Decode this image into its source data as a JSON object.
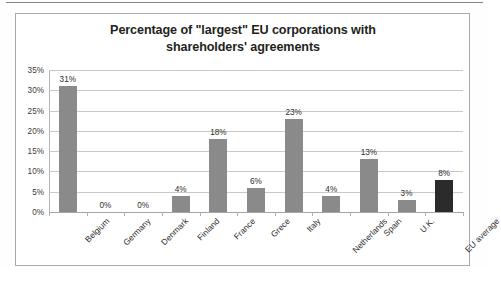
{
  "chart_data": {
    "type": "bar",
    "title": "Percentage of \"largest\" EU corporations with shareholders' agreements",
    "title_line1": "Percentage of \"largest\" EU corporations with",
    "title_line2": "shareholders' agreements",
    "xlabel": "",
    "ylabel": "",
    "ylim": [
      0,
      35
    ],
    "ytick_step": 5,
    "ytick_labels": [
      "35%",
      "30%",
      "25%",
      "20%",
      "15%",
      "10%",
      "5%",
      "0%"
    ],
    "ytick_values": [
      35,
      30,
      25,
      20,
      15,
      10,
      5,
      0
    ],
    "grid": true,
    "legend": false,
    "categories": [
      "Belgium",
      "Germany",
      "Denmark",
      "Finland",
      "France",
      "Grece",
      "Italy",
      "Netherlands",
      "Spain",
      "U.K.",
      "EU average"
    ],
    "values": [
      31,
      0,
      0,
      4,
      18,
      6,
      23,
      4,
      13,
      3,
      8
    ],
    "data_labels": [
      "31%",
      "0%",
      "0%",
      "4%",
      "18%",
      "6%",
      "23%",
      "4%",
      "13%",
      "3%",
      "8%"
    ],
    "bar_colors": [
      "#8a8a8a",
      "#8a8a8a",
      "#8a8a8a",
      "#8a8a8a",
      "#8a8a8a",
      "#8a8a8a",
      "#8a8a8a",
      "#8a8a8a",
      "#8a8a8a",
      "#8a8a8a",
      "#2b2b2b"
    ],
    "highlight_category": "EU average",
    "highlight_color": "#2b2b2b",
    "series_color": "#8a8a8a"
  }
}
